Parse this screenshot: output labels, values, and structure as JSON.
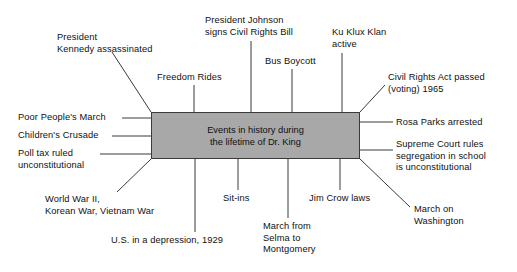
{
  "diagram": {
    "type": "cluster-web-diagram",
    "center": {
      "title_line1": "Events in history during",
      "title_line2": "the lifetime of Dr. King",
      "fill_color": "#a8a8a8",
      "border_color": "#3a3a3a"
    },
    "line_color": "#3a3a3a",
    "nodes": [
      {
        "id": "president-kennedy-assassinated",
        "lines": [
          "President",
          "Kennedy assassinated"
        ],
        "side": "top-left-diagonal",
        "x": 57,
        "y": 32,
        "align": "left"
      },
      {
        "id": "freedom-rides",
        "lines": [
          "Freedom Rides"
        ],
        "side": "top",
        "x": 157,
        "y": 72,
        "align": "left"
      },
      {
        "id": "president-johnson-signs-civil-rights-bill",
        "lines": [
          "President Johnson",
          "signs Civil Rights Bill"
        ],
        "side": "top",
        "x": 205,
        "y": 15,
        "align": "left"
      },
      {
        "id": "bus-boycott",
        "lines": [
          "Bus Boycott"
        ],
        "side": "top",
        "x": 265,
        "y": 56,
        "align": "left"
      },
      {
        "id": "ku-klux-klan-active",
        "lines": [
          "Ku Klux Klan",
          "active"
        ],
        "side": "top",
        "x": 332,
        "y": 27,
        "align": "left"
      },
      {
        "id": "civil-rights-act-passed-voting-1965",
        "lines": [
          "Civil Rights Act passed",
          "(voting) 1965"
        ],
        "side": "top-right-diagonal",
        "x": 388,
        "y": 72,
        "align": "left"
      },
      {
        "id": "rosa-parks-arrested",
        "lines": [
          "Rosa Parks arrested"
        ],
        "side": "right",
        "x": 396,
        "y": 117,
        "align": "left"
      },
      {
        "id": "supreme-court-rules-segregation-unconstitutional",
        "lines": [
          "Supreme Court rules",
          "segregation in school",
          "is unconstitutional"
        ],
        "side": "right",
        "x": 396,
        "y": 139,
        "align": "left"
      },
      {
        "id": "march-on-washington",
        "lines": [
          "March on",
          "Washington"
        ],
        "side": "bottom-right-diagonal",
        "x": 414,
        "y": 204,
        "align": "left"
      },
      {
        "id": "jim-crow-laws",
        "lines": [
          "Jim Crow laws"
        ],
        "side": "bottom",
        "x": 309,
        "y": 193,
        "align": "left"
      },
      {
        "id": "march-from-selma-to-montgomery",
        "lines": [
          "March from",
          "Selma to",
          "Montgomery"
        ],
        "side": "bottom",
        "x": 263,
        "y": 221,
        "align": "left"
      },
      {
        "id": "sit-ins",
        "lines": [
          "Sit-ins"
        ],
        "side": "bottom",
        "x": 223,
        "y": 193,
        "align": "left"
      },
      {
        "id": "us-in-a-depression-1929",
        "lines": [
          "U.S. in a depression, 1929"
        ],
        "side": "bottom",
        "x": 111,
        "y": 235,
        "align": "left"
      },
      {
        "id": "world-war-ii-korean-war-vietnam-war",
        "lines": [
          "World War II,",
          "Korean War, Vietnam War"
        ],
        "side": "bottom-left-diagonal",
        "x": 45,
        "y": 194,
        "align": "left"
      },
      {
        "id": "poll-tax-ruled-unconstitutional",
        "lines": [
          "Poll tax ruled",
          "unconstitutional"
        ],
        "side": "left",
        "x": 18,
        "y": 148,
        "align": "left"
      },
      {
        "id": "childrens-crusade",
        "lines": [
          "Children's Crusade"
        ],
        "side": "left",
        "x": 18,
        "y": 130,
        "align": "left"
      },
      {
        "id": "poor-peoples-march",
        "lines": [
          "Poor People's March"
        ],
        "side": "left",
        "x": 18,
        "y": 112,
        "align": "left"
      }
    ],
    "connectors": [
      {
        "id": "c-kennedy",
        "x1": 151,
        "y1": 112,
        "x2": 112,
        "y2": 52
      },
      {
        "id": "c-freedom-rides",
        "x1": 194,
        "y1": 112,
        "x2": 194,
        "y2": 85
      },
      {
        "id": "c-johnson",
        "x1": 251,
        "y1": 112,
        "x2": 251,
        "y2": 41
      },
      {
        "id": "c-bus-boycott",
        "x1": 292,
        "y1": 112,
        "x2": 292,
        "y2": 69
      },
      {
        "id": "c-kkk",
        "x1": 342,
        "y1": 112,
        "x2": 342,
        "y2": 53
      },
      {
        "id": "c-civil-rights-act",
        "x1": 360,
        "y1": 112,
        "x2": 385,
        "y2": 85
      },
      {
        "id": "c-rosa-parks",
        "x1": 360,
        "y1": 122,
        "x2": 393,
        "y2": 122
      },
      {
        "id": "c-supreme-court",
        "x1": 360,
        "y1": 150,
        "x2": 393,
        "y2": 150
      },
      {
        "id": "c-march-washington",
        "x1": 360,
        "y1": 159,
        "x2": 410,
        "y2": 207
      },
      {
        "id": "c-jim-crow",
        "x1": 340,
        "y1": 159,
        "x2": 340,
        "y2": 190
      },
      {
        "id": "c-selma",
        "x1": 288,
        "y1": 159,
        "x2": 288,
        "y2": 218
      },
      {
        "id": "c-sit-ins",
        "x1": 238,
        "y1": 159,
        "x2": 238,
        "y2": 190
      },
      {
        "id": "c-depression",
        "x1": 195,
        "y1": 159,
        "x2": 195,
        "y2": 232
      },
      {
        "id": "c-wwii",
        "x1": 151,
        "y1": 159,
        "x2": 117,
        "y2": 192
      },
      {
        "id": "c-poll-tax",
        "x1": 151,
        "y1": 154,
        "x2": 100,
        "y2": 154
      },
      {
        "id": "c-childrens-crusade",
        "x1": 151,
        "y1": 136,
        "x2": 112,
        "y2": 136
      },
      {
        "id": "c-poor-peoples-march",
        "x1": 151,
        "y1": 118,
        "x2": 122,
        "y2": 118
      }
    ]
  }
}
